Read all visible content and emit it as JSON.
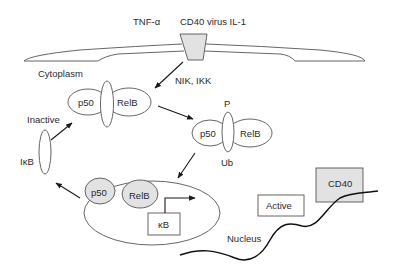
{
  "diagram": {
    "type": "NF-kB RelB activation pathway",
    "colors": {
      "stroke": "#555555",
      "shaded_fill": "#e2e2e2",
      "background": "#ffffff",
      "arrow": "#1a1a1a"
    },
    "stimuli": {
      "tnf": "TNF-α",
      "others": "CD40 virus IL-1"
    },
    "compartments": {
      "cytoplasm": "Cytoplasm",
      "nucleus": "Nucleus"
    },
    "kinases": "NIK, IKK",
    "inactive_complex": {
      "state": "Inactive",
      "p50": "p50",
      "relb": "RelB"
    },
    "modified_complex": {
      "phosphorylation": "P",
      "ubiquitination": "Ub",
      "p50": "p50",
      "relb": "RelB"
    },
    "inhibitor": "IκB",
    "nuclear_complex": {
      "p50": "p50",
      "relb": "RelB",
      "site": "κB"
    },
    "outputs": {
      "active": "Active",
      "target": "CD40"
    }
  }
}
